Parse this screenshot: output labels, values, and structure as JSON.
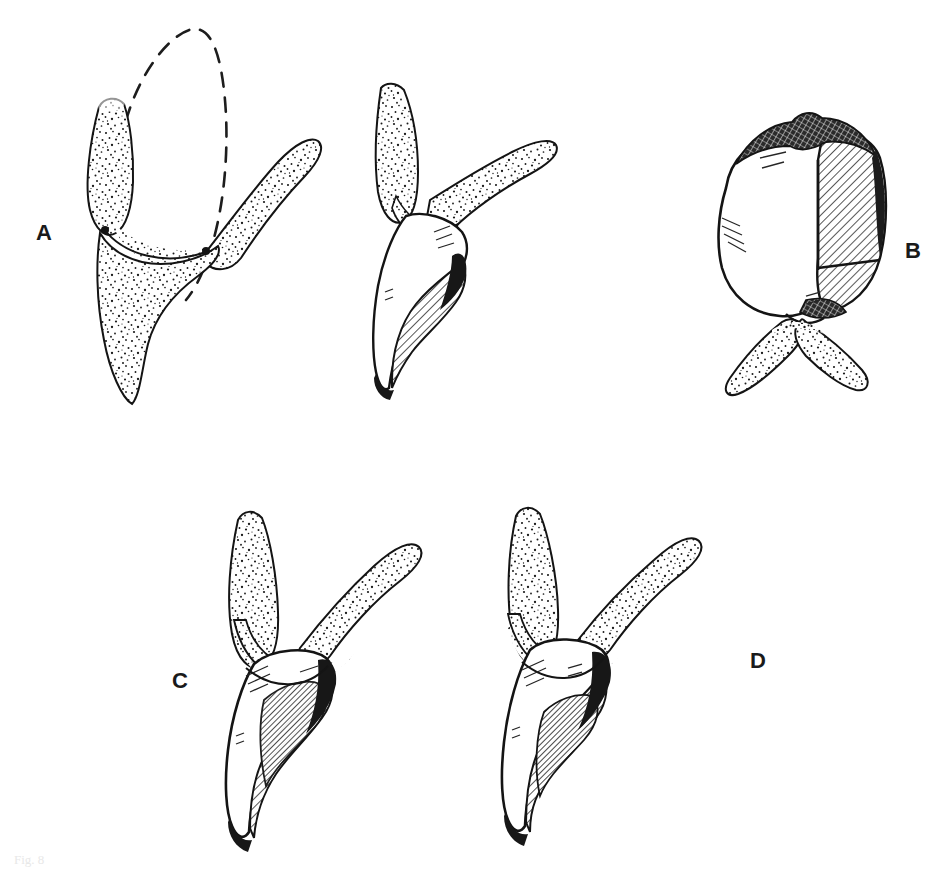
{
  "figure": {
    "background_color": "#ffffff",
    "ink_color": "#141414",
    "stipple_color": "#1a1a1a",
    "hatch_color": "#1e1e1e",
    "width": 951,
    "height": 869,
    "caption_fragment": "Fig. 8"
  },
  "panels": [
    {
      "id": "A",
      "label": "A",
      "label_position": {
        "x": 36,
        "y": 222
      },
      "description": "Sagittal section of anterior tooth in alveolar bone; dashed outline shows original crown contour, adjacent view shows prepared tooth with hatched restoration",
      "subfigures": [
        {
          "name": "original-crown-outline",
          "style": "dashed-line",
          "fill": "none"
        },
        {
          "name": "stippled-tooth-and-bone",
          "style": "stipple",
          "fill": "stipple"
        },
        {
          "name": "prepared-tooth-with-restoration",
          "style": "line-and-hatch",
          "fill": "diagonal-hatch"
        }
      ]
    },
    {
      "id": "B",
      "label": "B",
      "label_position": {
        "x": 905,
        "y": 240
      },
      "description": "Facial view of crowned tooth showing hatched restorative coverage over distal half, with stippled gingival/bone collar at cervix",
      "subfigures": [
        {
          "name": "crowned-tooth-facial-view",
          "style": "line-and-hatch",
          "fill": "diagonal-hatch"
        },
        {
          "name": "stippled-gingival-collar",
          "style": "stipple",
          "fill": "stipple"
        }
      ]
    },
    {
      "id": "C",
      "label": "C",
      "label_position": {
        "x": 172,
        "y": 670
      },
      "description": "Sagittal section of tooth with deep hatched restoration extending subgingivally, surrounded by stippled alveolar bone",
      "subfigures": [
        {
          "name": "stippled-alveolar-bone",
          "style": "stipple",
          "fill": "stipple"
        },
        {
          "name": "tooth-with-hatched-restoration",
          "style": "line-and-hatch",
          "fill": "diagonal-hatch"
        }
      ]
    },
    {
      "id": "D",
      "label": "D",
      "label_position": {
        "x": 750,
        "y": 650
      },
      "description": "Sagittal section of tooth with broader hatched restoration and altered gingival contour, surrounded by stippled alveolar bone",
      "subfigures": [
        {
          "name": "stippled-alveolar-bone",
          "style": "stipple",
          "fill": "stipple"
        },
        {
          "name": "tooth-with-hatched-restoration",
          "style": "line-and-hatch",
          "fill": "diagonal-hatch"
        }
      ]
    }
  ]
}
